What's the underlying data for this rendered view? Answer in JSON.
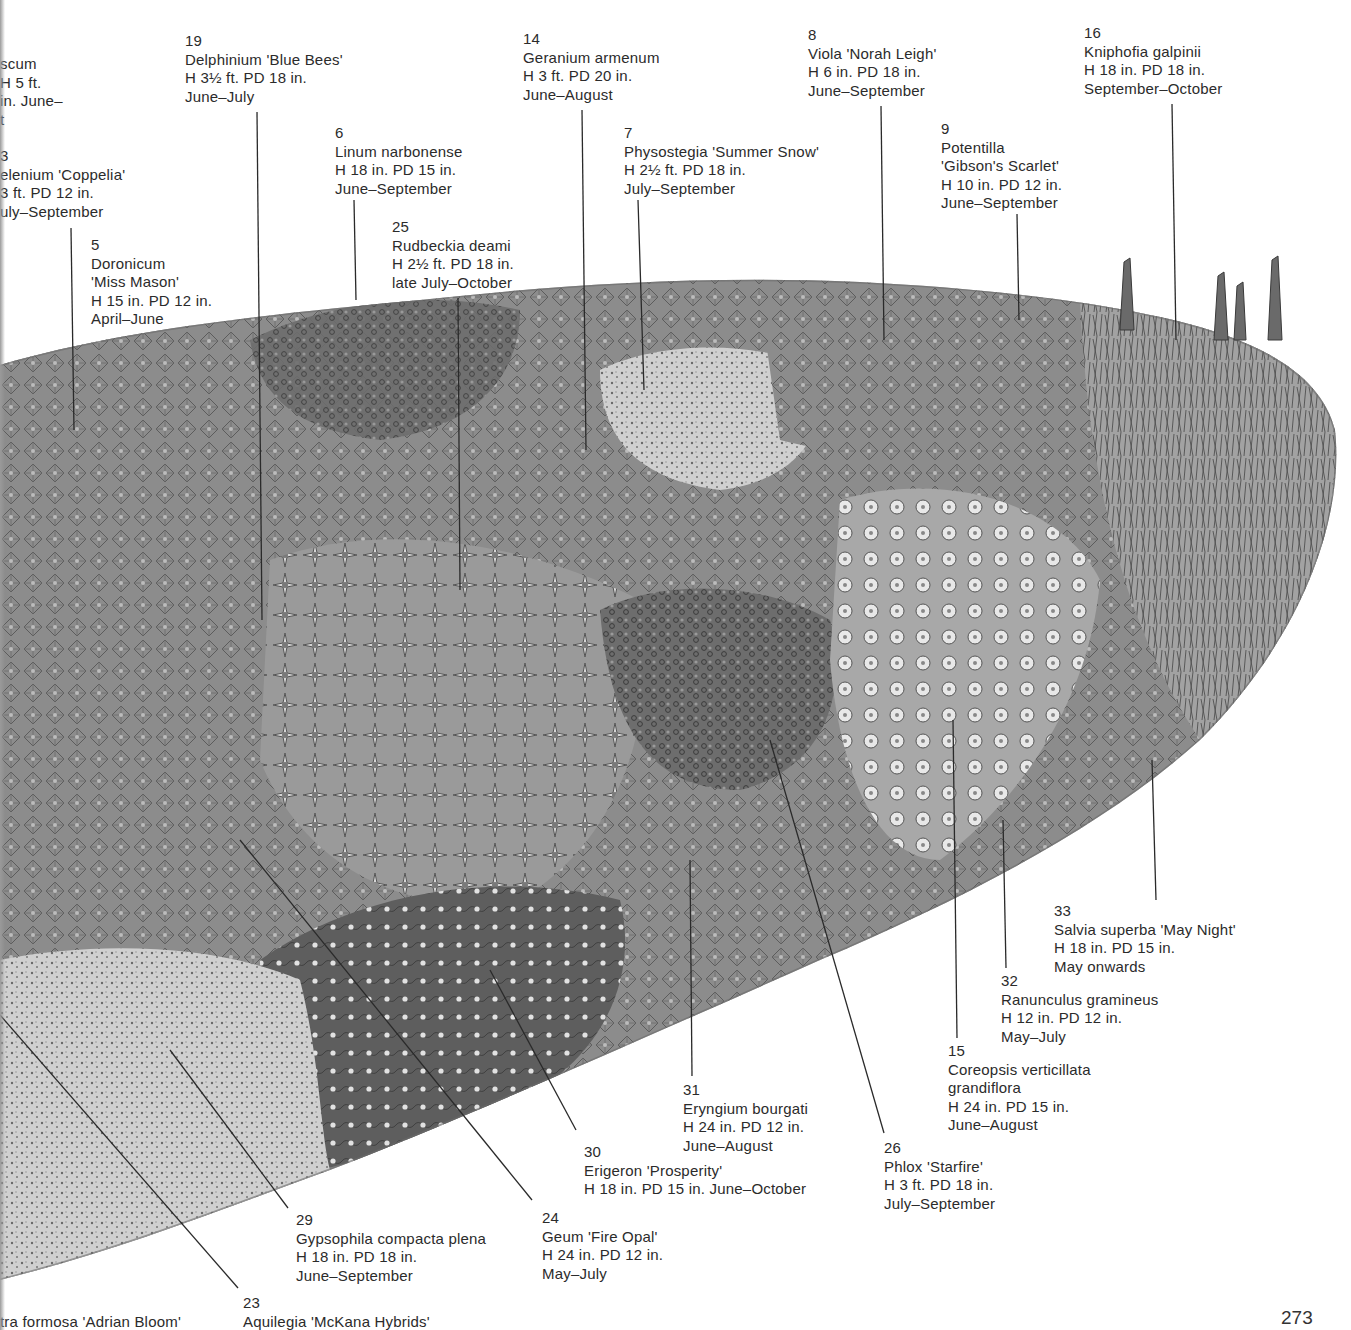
{
  "page": {
    "page_number": "273",
    "illustration": "Perennial border planting plan (pen-and-ink drawing)"
  },
  "labels": [
    {
      "id": "verbascum",
      "num": "",
      "lines": [
        "scum",
        "H 5 ft.",
        "in. June–",
        "t"
      ],
      "x": 0,
      "y": 55,
      "leader": null
    },
    {
      "id": "helenium",
      "num": "3",
      "lines": [
        "elenium 'Coppelia'",
        "3 ft. PD 12 in.",
        "uly–September"
      ],
      "x": 0,
      "y": 147,
      "leader": null
    },
    {
      "id": "doronicum",
      "num": "5",
      "lines": [
        "Doronicum",
        "'Miss Mason'",
        "H 15 in. PD 12 in.",
        "April–June"
      ],
      "x": 91,
      "y": 236,
      "leader": [
        [
          71,
          228
        ],
        [
          74,
          430
        ]
      ]
    },
    {
      "id": "delphinium",
      "num": "19",
      "lines": [
        "Delphinium 'Blue Bees'",
        "H 3½ ft. PD 18 in.",
        "June–July"
      ],
      "x": 185,
      "y": 32,
      "leader": [
        [
          257,
          112
        ],
        [
          262,
          620
        ]
      ]
    },
    {
      "id": "linum",
      "num": "6",
      "lines": [
        "Linum narbonense",
        "H 18 in. PD 15 in.",
        "June–September"
      ],
      "x": 335,
      "y": 124,
      "leader": [
        [
          354,
          200
        ],
        [
          356,
          300
        ]
      ]
    },
    {
      "id": "rudbeckia",
      "num": "25",
      "lines": [
        "Rudbeckia deami",
        "H 2½ ft. PD 18 in.",
        "late July–October"
      ],
      "x": 392,
      "y": 218,
      "leader": [
        [
          458,
          298
        ],
        [
          460,
          590
        ]
      ]
    },
    {
      "id": "geranium",
      "num": "14",
      "lines": [
        "Geranium armenum",
        "H 3 ft. PD 20 in.",
        "June–August"
      ],
      "x": 523,
      "y": 30,
      "leader": [
        [
          582,
          110
        ],
        [
          586,
          450
        ]
      ]
    },
    {
      "id": "physostegia",
      "num": "7",
      "lines": [
        "Physostegia 'Summer Snow'",
        "H 2½ ft. PD 18 in.",
        "July–September"
      ],
      "x": 624,
      "y": 124,
      "leader": [
        [
          638,
          200
        ],
        [
          644,
          390
        ]
      ]
    },
    {
      "id": "viola",
      "num": "8",
      "lines": [
        "Viola 'Norah Leigh'",
        "H 6 in. PD 18 in.",
        "June–September"
      ],
      "x": 808,
      "y": 26,
      "leader": [
        [
          881,
          106
        ],
        [
          884,
          340
        ]
      ]
    },
    {
      "id": "potentilla",
      "num": "9",
      "lines": [
        "Potentilla",
        "'Gibson's Scarlet'",
        "H 10 in. PD 12 in.",
        "June–September"
      ],
      "x": 941,
      "y": 120,
      "leader": [
        [
          1017,
          214
        ],
        [
          1019,
          320
        ]
      ]
    },
    {
      "id": "kniphofia",
      "num": "16",
      "lines": [
        "Kniphofia galpinii",
        "H 18 in. PD 18 in.",
        "September–October"
      ],
      "x": 1084,
      "y": 24,
      "leader": [
        [
          1172,
          104
        ],
        [
          1176,
          340
        ]
      ]
    },
    {
      "id": "salvia",
      "num": "33",
      "lines": [
        "Salvia superba 'May Night'",
        "H 18 in. PD 15 in.",
        "May onwards"
      ],
      "x": 1054,
      "y": 902,
      "leader": [
        [
          1156,
          900
        ],
        [
          1152,
          760
        ]
      ]
    },
    {
      "id": "ranunculus",
      "num": "32",
      "lines": [
        "Ranunculus gramineus",
        "H 12 in. PD 12 in.",
        "May–July"
      ],
      "x": 1001,
      "y": 972,
      "leader": [
        [
          1006,
          968
        ],
        [
          1003,
          820
        ]
      ]
    },
    {
      "id": "coreopsis",
      "num": "15",
      "lines": [
        "Coreopsis verticillata",
        "grandiflora",
        "H 24 in. PD 15 in.",
        "June–August"
      ],
      "x": 948,
      "y": 1042,
      "leader": [
        [
          957,
          1038
        ],
        [
          953,
          720
        ]
      ]
    },
    {
      "id": "phlox",
      "num": "26",
      "lines": [
        "Phlox 'Starfire'",
        "H 3 ft. PD 18 in.",
        "July–September"
      ],
      "x": 884,
      "y": 1139,
      "leader": [
        [
          884,
          1133
        ],
        [
          770,
          740
        ]
      ]
    },
    {
      "id": "eryngium",
      "num": "31",
      "lines": [
        "Eryngium bourgati",
        "H 24 in. PD 12 in.",
        "June–August"
      ],
      "x": 683,
      "y": 1081,
      "leader": [
        [
          692,
          1076
        ],
        [
          690,
          860
        ]
      ]
    },
    {
      "id": "erigeron",
      "num": "30",
      "lines": [
        "Erigeron 'Prosperity'",
        "H 18 in. PD 15 in. June–October"
      ],
      "x": 584,
      "y": 1143,
      "leader": [
        [
          576,
          1130
        ],
        [
          490,
          970
        ]
      ]
    },
    {
      "id": "geum",
      "num": "24",
      "lines": [
        "Geum 'Fire Opal'",
        "H 24 in. PD 12 in.",
        "May–July"
      ],
      "x": 542,
      "y": 1209,
      "leader": [
        [
          532,
          1200
        ],
        [
          240,
          840
        ]
      ]
    },
    {
      "id": "gypsophila",
      "num": "29",
      "lines": [
        "Gypsophila compacta plena",
        "H 18 in. PD 18 in.",
        "June–September"
      ],
      "x": 296,
      "y": 1211,
      "leader": [
        [
          288,
          1208
        ],
        [
          170,
          1050
        ]
      ]
    },
    {
      "id": "aquilegia",
      "num": "23",
      "lines": [
        "Aquilegia 'McKana Hybrids'"
      ],
      "x": 243,
      "y": 1294,
      "leader": [
        [
          238,
          1288
        ],
        [
          0,
          1015
        ]
      ]
    },
    {
      "id": "heuchera",
      "num": "",
      "lines": [
        "tra formosa 'Adrian Bloom'"
      ],
      "x": 0,
      "y": 1313,
      "leader": null
    }
  ],
  "colors": {
    "ink": "#2b2b2b",
    "bed_mid": "#8a8a8a",
    "bed_dark": "#5a5a5a",
    "bed_light": "#bdbdbd",
    "paper": "#ffffff"
  }
}
